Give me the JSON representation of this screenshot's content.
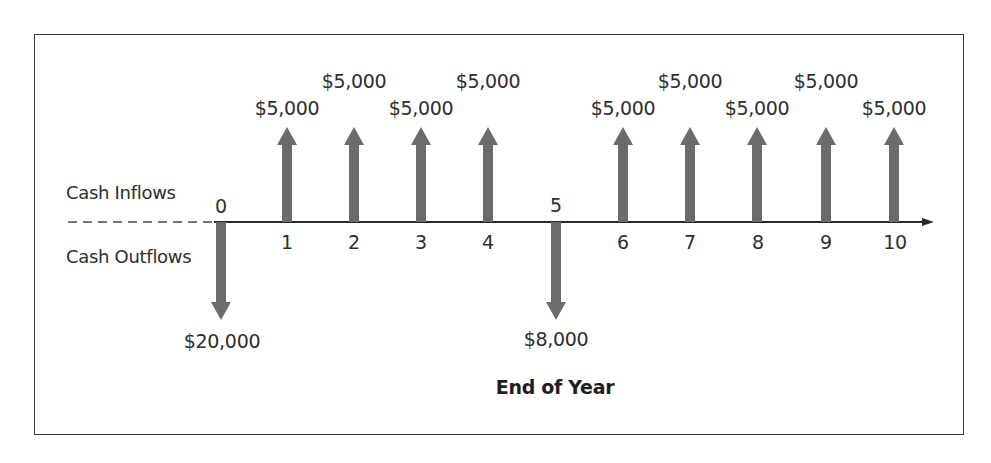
{
  "chart_data": {
    "type": "cash-flow-timeline",
    "xlabel": "End of Year",
    "side_labels": {
      "inflows": "Cash Inflows",
      "outflows": "Cash Outflows"
    },
    "ticks": [
      "0",
      "1",
      "2",
      "3",
      "4",
      "5",
      "6",
      "7",
      "8",
      "9",
      "10"
    ],
    "flows": [
      {
        "year": 0,
        "direction": "outflow",
        "amount": 20000,
        "label": "$20,000"
      },
      {
        "year": 1,
        "direction": "inflow",
        "amount": 5000,
        "label": "$5,000"
      },
      {
        "year": 2,
        "direction": "inflow",
        "amount": 5000,
        "label": "$5,000"
      },
      {
        "year": 3,
        "direction": "inflow",
        "amount": 5000,
        "label": "$5,000"
      },
      {
        "year": 4,
        "direction": "inflow",
        "amount": 5000,
        "label": "$5,000"
      },
      {
        "year": 5,
        "direction": "outflow",
        "amount": 8000,
        "label": "$8,000"
      },
      {
        "year": 6,
        "direction": "inflow",
        "amount": 5000,
        "label": "$5,000"
      },
      {
        "year": 7,
        "direction": "inflow",
        "amount": 5000,
        "label": "$5,000"
      },
      {
        "year": 8,
        "direction": "inflow",
        "amount": 5000,
        "label": "$5,000"
      },
      {
        "year": 9,
        "direction": "inflow",
        "amount": 5000,
        "label": "$5,000"
      },
      {
        "year": 10,
        "direction": "inflow",
        "amount": 5000,
        "label": "$5,000"
      }
    ],
    "colors": {
      "arrow": "#6b6b6b",
      "axis": "#2a2a2a",
      "frame": "#3a3a3a"
    }
  }
}
